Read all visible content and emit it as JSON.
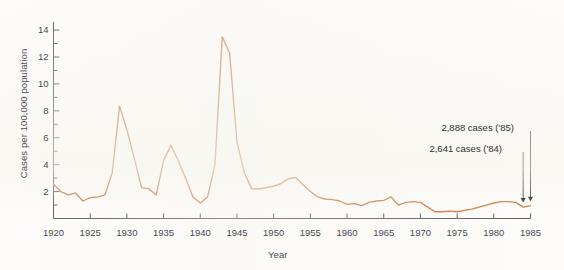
{
  "figure": {
    "background_color": "#fdfcfa",
    "line_color": "#c8763c",
    "axis_color": "#56565c",
    "text_color": "#4a4a50"
  },
  "axes": {
    "ylabel": "Cases per 100,000 population",
    "xlabel": "Year",
    "y_ticks_major": [
      "2",
      "4",
      "6",
      "8",
      "10",
      "12",
      "14"
    ],
    "x_ticks": [
      "1920",
      "1925",
      "1930",
      "1935",
      "1940",
      "1945",
      "1950",
      "1955",
      "1960",
      "1965",
      "1970",
      "1975",
      "1980",
      "1985"
    ]
  },
  "annotations": {
    "top": "2,888 cases ('85)",
    "bottom": "2,641 cases ('84)"
  },
  "chart_data": {
    "type": "line",
    "title": "",
    "xlabel": "Year",
    "ylabel": "Cases per 100,000 population",
    "xlim": [
      1920,
      1985
    ],
    "ylim": [
      0,
      14.6
    ],
    "grid": false,
    "legend": "none",
    "y_tick_interval_major": 2,
    "y_tick_interval_minor": 1,
    "x_tick_interval": 5,
    "series": [
      {
        "name": "Cases per 100,000 population",
        "color": "#c8763c",
        "x": [
          1920,
          1921,
          1922,
          1923,
          1924,
          1925,
          1926,
          1927,
          1928,
          1929,
          1930,
          1931,
          1932,
          1933,
          1934,
          1935,
          1936,
          1937,
          1938,
          1939,
          1940,
          1941,
          1942,
          1943,
          1944,
          1945,
          1946,
          1947,
          1948,
          1949,
          1950,
          1951,
          1952,
          1953,
          1954,
          1955,
          1956,
          1957,
          1958,
          1959,
          1960,
          1961,
          1962,
          1963,
          1964,
          1965,
          1966,
          1967,
          1968,
          1969,
          1970,
          1971,
          1972,
          1973,
          1974,
          1975,
          1976,
          1977,
          1978,
          1979,
          1980,
          1981,
          1982,
          1983,
          1984,
          1985
        ],
        "y": [
          2.55,
          2.0,
          1.75,
          1.9,
          1.3,
          1.55,
          1.6,
          1.75,
          3.4,
          8.35,
          6.6,
          4.5,
          2.3,
          2.2,
          1.75,
          4.3,
          5.45,
          4.3,
          3.0,
          1.6,
          1.15,
          1.6,
          4.0,
          13.5,
          12.3,
          5.7,
          3.4,
          2.2,
          2.2,
          2.3,
          2.4,
          2.6,
          2.95,
          3.05,
          2.5,
          2.0,
          1.6,
          1.45,
          1.4,
          1.3,
          1.05,
          1.1,
          0.95,
          1.2,
          1.3,
          1.35,
          1.6,
          1.0,
          1.2,
          1.25,
          1.2,
          0.85,
          0.5,
          0.5,
          0.55,
          0.5,
          0.6,
          0.7,
          0.85,
          1.0,
          1.15,
          1.25,
          1.25,
          1.2,
          0.85,
          0.95
        ]
      }
    ],
    "annotations": [
      {
        "label": "2,888 cases ('85)",
        "year": 1985,
        "value": 0.95
      },
      {
        "label": "2,641 cases ('84)",
        "year": 1984,
        "value": 0.85
      }
    ]
  }
}
